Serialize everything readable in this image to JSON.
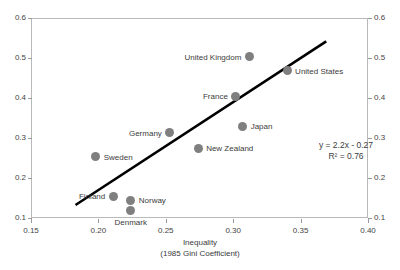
{
  "chart_data": {
    "type": "scatter",
    "title": "",
    "xlabel": "Inequality",
    "xlabel_line2": "(1985 Gini Coefficient)",
    "ylabel": "",
    "xlim": [
      0.15,
      0.4
    ],
    "ylim": [
      0.1,
      0.6
    ],
    "xticks": [
      "0.15",
      "0.20",
      "0.25",
      "0.30",
      "0.35",
      "0.40"
    ],
    "xtick_values": [
      0.15,
      0.2,
      0.25,
      0.3,
      0.35,
      0.4
    ],
    "yticks": [
      "0.1",
      "0.2",
      "0.3",
      "0.4",
      "0.5",
      "0.6"
    ],
    "ytick_values": [
      0.1,
      0.2,
      0.3,
      0.4,
      0.5,
      0.6
    ],
    "yticks_right": [
      "0.1",
      "0.2",
      "0.3",
      "0.4",
      "0.5",
      "0.6"
    ],
    "grid": false,
    "legend": "none",
    "marker_color": "#7f7f7f",
    "trendline_color": "#000000",
    "axis_color": "#b9b9b9",
    "points": [
      {
        "name": "United Kingdom",
        "x": 0.312,
        "y": 0.503,
        "label_side": "left"
      },
      {
        "name": "United States",
        "x": 0.34,
        "y": 0.468,
        "label_side": "right"
      },
      {
        "name": "France",
        "x": 0.302,
        "y": 0.405,
        "label_side": "left"
      },
      {
        "name": "Japan",
        "x": 0.307,
        "y": 0.33,
        "label_side": "right"
      },
      {
        "name": "Germany",
        "x": 0.253,
        "y": 0.313,
        "label_side": "left"
      },
      {
        "name": "New Zealand",
        "x": 0.274,
        "y": 0.275,
        "label_side": "right"
      },
      {
        "name": "Sweden",
        "x": 0.198,
        "y": 0.253,
        "label_side": "right"
      },
      {
        "name": "Finland",
        "x": 0.211,
        "y": 0.155,
        "label_side": "left"
      },
      {
        "name": "Norway",
        "x": 0.224,
        "y": 0.145,
        "label_side": "right"
      },
      {
        "name": "Denmark",
        "x": 0.224,
        "y": 0.118,
        "label_side": "below"
      }
    ],
    "trendline": {
      "equation": "y = 2.2x - 0.27",
      "r_squared_label": "R² = 0.76",
      "slope": 2.2,
      "intercept": -0.27,
      "r2": 0.76,
      "x_start": 0.183,
      "x_end": 0.369
    },
    "annotations": [
      {
        "name": "equation-annotation",
        "text": "y = 2.2x - 0.27"
      },
      {
        "name": "r-squared-annotation",
        "text": "R² = 0.76"
      }
    ]
  }
}
